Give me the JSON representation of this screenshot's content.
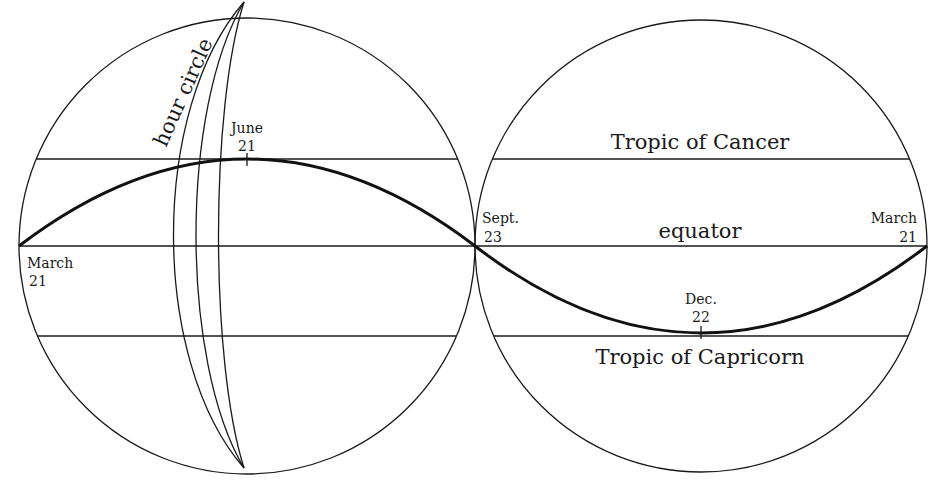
{
  "diagram": {
    "left_sphere": {
      "labels": {
        "hour_circle": "hour circle",
        "june_month": "June",
        "june_day": "21",
        "march_month": "March",
        "march_day": "21"
      }
    },
    "right_sphere": {
      "labels": {
        "tropic_cancer": "Tropic of Cancer",
        "equator": "equator",
        "tropic_capricorn": "Tropic of Capricorn",
        "sept_month": "Sept.",
        "sept_day": "23",
        "dec_month": "Dec.",
        "dec_day": "22",
        "march_month": "March",
        "march_day": "21"
      }
    },
    "line_color": "#1a1a1a",
    "background": "#ffffff"
  }
}
